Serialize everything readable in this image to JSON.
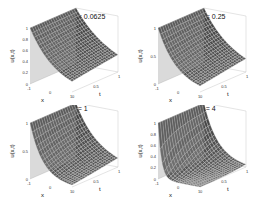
{
  "chart_data": [
    {
      "type": "surface",
      "title": "a = 0.0625",
      "xlabel": "x",
      "ylabel": "t",
      "zlabel": "u(x,t)",
      "xticks": [
        "-1",
        "0",
        "1"
      ],
      "yticks": [
        "0",
        "0.5",
        "1"
      ],
      "zticks": [
        "0",
        "0.2",
        "0.4",
        "0.6",
        "0.8",
        "1"
      ],
      "xlim": [
        -1,
        1
      ],
      "ylim": [
        0,
        1
      ],
      "zlim": [
        0,
        1
      ],
      "a": 0.0625
    },
    {
      "type": "surface",
      "title": "a = 0.25",
      "xlabel": "x",
      "ylabel": "t",
      "zlabel": "u(x,t)",
      "xticks": [
        "-1",
        "0",
        "1"
      ],
      "yticks": [
        "0",
        "0.5",
        "1"
      ],
      "zticks": [
        "0",
        "0.5",
        "1"
      ],
      "xlim": [
        -1,
        1
      ],
      "ylim": [
        0,
        1
      ],
      "zlim": [
        0,
        1
      ],
      "a": 0.25
    },
    {
      "type": "surface",
      "title": "a = 1",
      "xlabel": "x",
      "ylabel": "t",
      "zlabel": "u(x,t)",
      "xticks": [
        "-1",
        "0",
        "1"
      ],
      "yticks": [
        "0",
        "0.5",
        "1"
      ],
      "zticks": [
        "0",
        "0.5",
        "1"
      ],
      "xlim": [
        -1,
        1
      ],
      "ylim": [
        0,
        1
      ],
      "zlim": [
        0,
        1
      ],
      "a": 1
    },
    {
      "type": "surface",
      "title": "a = 4",
      "xlabel": "x",
      "ylabel": "t",
      "zlabel": "u(x,t)",
      "xticks": [
        "-1",
        "0",
        "1"
      ],
      "yticks": [
        "0",
        "0.5",
        "1"
      ],
      "zticks": [
        "0",
        "0.2",
        "0.4",
        "0.6",
        "0.8",
        "1"
      ],
      "xlim": [
        -1,
        1
      ],
      "ylim": [
        0,
        1
      ],
      "zlim": [
        0,
        1
      ],
      "a": 4
    }
  ]
}
